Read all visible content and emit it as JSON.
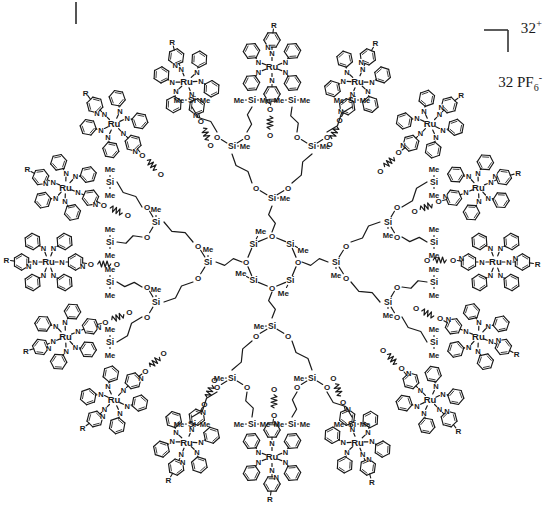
{
  "figure": {
    "kind": "chemical-structure-diagram",
    "charge_label": "32",
    "charge_sign": "+",
    "counterion_count": "32",
    "counterion_formula": "PF",
    "counterion_subscript": "6",
    "counterion_charge": "-"
  },
  "labels": {
    "metal": "Ru",
    "nitrogen": "N",
    "oxygen": "O",
    "silicon": "Si",
    "methyl": "Me",
    "substituent": "R"
  },
  "core": {
    "name": "cyclotetrasiloxane-D4-ring",
    "ring_atoms": [
      "Si",
      "O",
      "Si",
      "O",
      "Si",
      "O",
      "Si",
      "O"
    ],
    "silicon_count": 4,
    "oxygen_count": 4,
    "methyl_per_silicon": 1,
    "arm_count": 4
  },
  "dendrimer": {
    "generations": 3,
    "branch_multiplicity": 2,
    "terminal_unit": "Si(Me)2",
    "spacer": "propylene",
    "linker": "squiggle-bond"
  },
  "periphery": {
    "unit_name": "ruthenium-bis-terpyridine",
    "unit_count": 16,
    "charge_per_unit": 2,
    "donor_atoms_per_unit": 6,
    "outer_substituent": "R",
    "inner_linker_atom": "O"
  },
  "chart_data": {
    "type": "diagram",
    "title": "",
    "ru_centers": 16,
    "quadrant_counts": [
      4,
      4,
      4,
      4
    ],
    "total_positive_charge": 32,
    "counterions": 32,
    "ru_complexes": [
      {
        "id": 1,
        "angle": -90.0,
        "label": "Ru"
      },
      {
        "id": 2,
        "angle": -67.5,
        "label": "Ru"
      },
      {
        "id": 3,
        "angle": -45.0,
        "label": "Ru"
      },
      {
        "id": 4,
        "angle": -22.5,
        "label": "Ru"
      },
      {
        "id": 5,
        "angle": 0.0,
        "label": "Ru"
      },
      {
        "id": 6,
        "angle": 22.5,
        "label": "Ru"
      },
      {
        "id": 7,
        "angle": 45.0,
        "label": "Ru"
      },
      {
        "id": 8,
        "angle": 67.5,
        "label": "Ru"
      },
      {
        "id": 9,
        "angle": 90.0,
        "label": "Ru"
      },
      {
        "id": 10,
        "angle": 112.5,
        "label": "Ru"
      },
      {
        "id": 11,
        "angle": 135.0,
        "label": "Ru"
      },
      {
        "id": 12,
        "angle": 157.5,
        "label": "Ru"
      },
      {
        "id": 13,
        "angle": 180.0,
        "label": "Ru"
      },
      {
        "id": 14,
        "angle": 202.5,
        "label": "Ru"
      },
      {
        "id": 15,
        "angle": 225.0,
        "label": "Ru"
      },
      {
        "id": 16,
        "angle": 247.5,
        "label": "Ru"
      }
    ]
  },
  "colors": {
    "ink": "#1a1a1a",
    "background": "#ffffff"
  }
}
